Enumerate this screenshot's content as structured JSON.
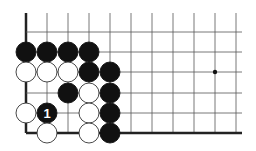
{
  "board": {
    "description": "Go problem diagram (lower-left corner view)",
    "grid": {
      "columns": 11,
      "rows": 6,
      "col_x": [
        26,
        47,
        68,
        89,
        110,
        131,
        152,
        173,
        194,
        215,
        236
      ],
      "row_y": [
        32,
        52,
        72,
        93,
        113,
        133
      ],
      "top_extend_y": 13,
      "right_extend_x": 242,
      "edges": [
        "left",
        "bottom"
      ],
      "line_color": "#555555",
      "edge_color": "#222222"
    },
    "hoshi": [
      {
        "col": 9,
        "row": 2
      }
    ],
    "stones": [
      {
        "color": "black",
        "col": 0,
        "row": 1
      },
      {
        "color": "black",
        "col": 1,
        "row": 1
      },
      {
        "color": "black",
        "col": 2,
        "row": 1
      },
      {
        "color": "black",
        "col": 3,
        "row": 1
      },
      {
        "color": "white",
        "col": 0,
        "row": 2
      },
      {
        "color": "white",
        "col": 1,
        "row": 2
      },
      {
        "color": "white",
        "col": 2,
        "row": 2
      },
      {
        "color": "black",
        "col": 3,
        "row": 2
      },
      {
        "color": "black",
        "col": 4,
        "row": 2
      },
      {
        "color": "black",
        "col": 2,
        "row": 3
      },
      {
        "color": "white",
        "col": 3,
        "row": 3
      },
      {
        "color": "black",
        "col": 4,
        "row": 3
      },
      {
        "color": "white",
        "col": 0,
        "row": 4
      },
      {
        "color": "black",
        "col": 1,
        "row": 4,
        "label": "1"
      },
      {
        "color": "white",
        "col": 3,
        "row": 4
      },
      {
        "color": "black",
        "col": 4,
        "row": 4
      },
      {
        "color": "white",
        "col": 1,
        "row": 5
      },
      {
        "color": "white",
        "col": 3,
        "row": 5
      },
      {
        "color": "black",
        "col": 4,
        "row": 5
      }
    ],
    "colors": {
      "black_stone": "#111111",
      "white_stone": "#ffffff",
      "white_outline": "#333333",
      "label_on_black": "#ffffff"
    }
  }
}
